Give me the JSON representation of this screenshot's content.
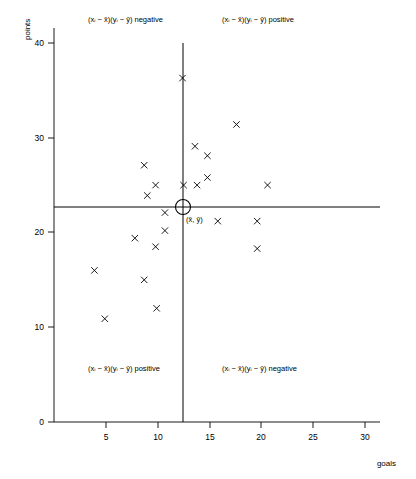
{
  "chart_data": {
    "type": "scatter",
    "title": "",
    "xlabel": "goals",
    "ylabel": "points",
    "xlim": [
      0,
      32
    ],
    "ylim": [
      0,
      42
    ],
    "xticks": [
      5,
      10,
      15,
      20,
      25,
      30
    ],
    "yticks": [
      0,
      10,
      20,
      30,
      40
    ],
    "grid": false,
    "legend": null,
    "x": [
      12.4,
      17.6,
      13.6,
      14.8,
      8.7,
      9.8,
      14.8,
      12.5,
      13.8,
      20.6,
      9.0,
      10.7,
      15.8,
      19.6,
      10.7,
      7.8,
      9.8,
      19.6,
      3.9,
      8.7,
      9.9,
      4.9
    ],
    "y": [
      36.3,
      31.4,
      29.1,
      28.1,
      27.1,
      25.0,
      25.8,
      25.0,
      25.0,
      25.0,
      23.9,
      22.1,
      21.2,
      21.2,
      20.2,
      19.4,
      18.5,
      18.3,
      16.0,
      15.0,
      12.0,
      10.9
    ],
    "points": [
      {
        "x": 12.4,
        "y": 36.3
      },
      {
        "x": 17.6,
        "y": 31.4
      },
      {
        "x": 13.6,
        "y": 29.1
      },
      {
        "x": 14.8,
        "y": 28.1
      },
      {
        "x": 8.7,
        "y": 27.1
      },
      {
        "x": 9.8,
        "y": 25.0
      },
      {
        "x": 14.8,
        "y": 25.8
      },
      {
        "x": 12.5,
        "y": 25.0
      },
      {
        "x": 13.8,
        "y": 25.0
      },
      {
        "x": 20.6,
        "y": 25.0
      },
      {
        "x": 9.0,
        "y": 23.9
      },
      {
        "x": 10.7,
        "y": 22.1
      },
      {
        "x": 15.8,
        "y": 21.2
      },
      {
        "x": 19.6,
        "y": 21.2
      },
      {
        "x": 10.7,
        "y": 20.2
      },
      {
        "x": 7.8,
        "y": 19.4
      },
      {
        "x": 9.8,
        "y": 18.5
      },
      {
        "x": 19.6,
        "y": 18.3
      },
      {
        "x": 3.9,
        "y": 16.0
      },
      {
        "x": 8.7,
        "y": 15.0
      },
      {
        "x": 9.9,
        "y": 12.0
      },
      {
        "x": 4.9,
        "y": 10.9
      }
    ],
    "marker": "x",
    "mean": {
      "x": 12.4,
      "y": 22.7,
      "label": "(x̄, ȳ)"
    },
    "reference_lines": [
      {
        "orientation": "vertical",
        "value": 12.4,
        "label": "x-bar"
      },
      {
        "orientation": "horizontal",
        "value": 22.7,
        "label": "y-bar"
      }
    ],
    "annotations": [
      {
        "id": "top-left",
        "quadrant": "upper-left",
        "text": "(xᵢ − x̄)(yᵢ − ȳ) negative"
      },
      {
        "id": "top-right",
        "quadrant": "upper-right",
        "text": "(xᵢ − x̄)(yᵢ − ȳ) positive"
      },
      {
        "id": "bottom-left",
        "quadrant": "lower-left",
        "text": "(xᵢ − x̄)(yᵢ − ȳ) positive"
      },
      {
        "id": "bottom-right",
        "quadrant": "lower-right",
        "text": "(xᵢ − x̄)(yᵢ − ȳ) negative"
      }
    ]
  },
  "axes": {
    "y_label": "points",
    "x_label": "goals",
    "x_tick_labels": [
      "5",
      "10",
      "15",
      "20",
      "25",
      "30"
    ],
    "y_tick_labels": [
      "40",
      "30",
      "20",
      "10",
      "0"
    ]
  },
  "quadrants": {
    "top_left_prefix": "(x",
    "sub_i": "i",
    "minus": " − ",
    "xbar": "x̄",
    "mid": ")(y",
    "ybar": "ȳ",
    "close": ") ",
    "negative": "negative",
    "positive": "positive"
  },
  "labels": {
    "q_tl_full": "(xᵢ − x̄)(yᵢ − ȳ) negative",
    "q_tr_full": "(xᵢ − x̄)(yᵢ − ȳ) positive",
    "q_bl_full": "(xᵢ − x̄)(yᵢ − ȳ) positive",
    "q_br_full": "(xᵢ − x̄)(yᵢ − ȳ) negative",
    "mean_point": "(x̄, ȳ)"
  },
  "colors": {
    "background": "#ffffff",
    "ink": "#000000",
    "marker": "#000000"
  }
}
